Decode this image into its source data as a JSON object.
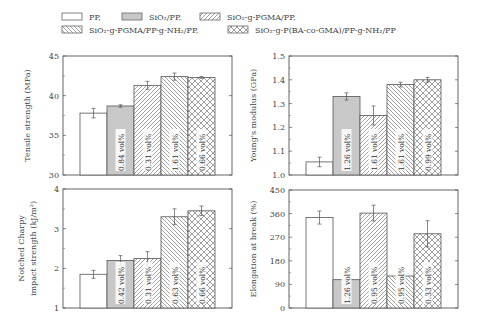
{
  "legend": {
    "items": [
      {
        "key": "pp",
        "label": "PP,",
        "pattern": "empty"
      },
      {
        "key": "sio2",
        "label": "SiO₂/PP,",
        "pattern": "gray"
      },
      {
        "key": "pgma",
        "label": "SiO₂-g-PGMA/PP,",
        "pattern": "fwd"
      },
      {
        "key": "pgma_nh2",
        "label": "SiO₂-g-PGMA/PP-g-NH₂/PP,",
        "pattern": "back"
      },
      {
        "key": "ba_gma",
        "label": "SiO₂-g-P(BA-co-GMA)/PP-g-NH₂/PP",
        "pattern": "cross"
      }
    ]
  },
  "colors": {
    "frame": "#555555",
    "gray_fill": "#c8c8c8",
    "hatch": "#777777",
    "error": "#555555"
  },
  "chart_data": [
    {
      "type": "bar",
      "title": "",
      "ylabel": "Tensile strength (MPa)",
      "ylim": [
        30,
        45
      ],
      "yticks": [
        30,
        35,
        40,
        45
      ],
      "categories": [
        "PP",
        "SiO2/PP",
        "SiO2-g-PGMA/PP",
        "SiO2-g-PGMA/PP-g-NH2/PP",
        "SiO2-g-P(BA-co-GMA)/PP-g-NH2/PP"
      ],
      "values": [
        37.8,
        38.7,
        41.3,
        42.4,
        42.3
      ],
      "errors": [
        0.6,
        0.15,
        0.5,
        0.45,
        0.1
      ],
      "bar_labels": [
        "",
        "0.84 vol%",
        "0.31 vol%",
        "1.61 vol%",
        "0.66 vol%"
      ]
    },
    {
      "type": "bar",
      "title": "",
      "ylabel": "Young's modulus (GPa)",
      "ylim": [
        1.0,
        1.5
      ],
      "yticks": [
        1.0,
        1.1,
        1.2,
        1.3,
        1.4,
        1.5
      ],
      "categories": [
        "PP",
        "SiO2/PP",
        "SiO2-g-PGMA/PP",
        "SiO2-g-PGMA/PP-g-NH2/PP",
        "SiO2-g-P(BA-co-GMA)/PP-g-NH2/PP"
      ],
      "values": [
        1.055,
        1.33,
        1.25,
        1.38,
        1.4
      ],
      "errors": [
        0.02,
        0.015,
        0.04,
        0.01,
        0.01
      ],
      "bar_labels": [
        "",
        "1.26 vol%",
        "1.61 vol%",
        "1.61 vol%",
        "0.99 vol%"
      ]
    },
    {
      "type": "bar",
      "title": "",
      "ylabel": "Notched Charpy impact strength (kJ/m²)",
      "ylabel_lines": [
        "Notched Charpy",
        "impact strength (kJ/m²)"
      ],
      "ylim": [
        1,
        4
      ],
      "yticks": [
        1,
        2,
        3,
        4
      ],
      "categories": [
        "PP",
        "SiO2/PP",
        "SiO2-g-PGMA/PP",
        "SiO2-g-PGMA/PP-g-NH2/PP",
        "SiO2-g-P(BA-co-GMA)/PP-g-NH2/PP"
      ],
      "values": [
        1.85,
        2.2,
        2.25,
        3.3,
        3.45
      ],
      "errors": [
        0.1,
        0.12,
        0.17,
        0.2,
        0.12
      ],
      "bar_labels": [
        "",
        "0.42 vol%",
        "0.31 vol%",
        "0.63 vol%",
        "0.66 vol%"
      ]
    },
    {
      "type": "bar",
      "title": "",
      "ylabel": "Elongation at break (%)",
      "ylim": [
        0,
        450
      ],
      "yticks": [
        0,
        90,
        180,
        270,
        360,
        450
      ],
      "categories": [
        "PP",
        "SiO2/PP",
        "SiO2-g-PGMA/PP",
        "SiO2-g-PGMA/PP-g-NH2/PP",
        "SiO2-g-P(BA-co-GMA)/PP-g-NH2/PP"
      ],
      "values": [
        345,
        108,
        362,
        122,
        283
      ],
      "errors": [
        25,
        0,
        30,
        0,
        50
      ],
      "bar_labels": [
        "",
        "1.26 vol%",
        "0.95 vol%",
        "0.95 vol%",
        "0.33 vol%"
      ]
    }
  ]
}
